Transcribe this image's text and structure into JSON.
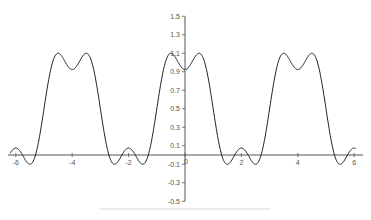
{
  "chart_data": {
    "type": "line",
    "title": "",
    "xlabel": "",
    "ylabel": "",
    "xlim": [
      -6.2,
      6.2
    ],
    "ylim": [
      -0.5,
      1.5
    ],
    "grid": false,
    "legend": null,
    "x_ticks": [
      -6,
      -4,
      -2,
      0,
      2,
      4,
      6
    ],
    "x_tick_labels": [
      "-6",
      "-4",
      "-2",
      "0",
      "2",
      "4",
      "6"
    ],
    "y_ticks": [
      1.5,
      1.3,
      1.1,
      0.9,
      0.7,
      0.5,
      0.3,
      0.1,
      -0.1,
      -0.3,
      -0.5
    ],
    "y_tick_labels": [
      "1.5",
      "1.3",
      "1.1",
      "0.9",
      "0.7",
      "0.5",
      "0.3",
      "0.1",
      "-0.1",
      "-0.3",
      "-0.5"
    ],
    "series": [
      {
        "name": "f(x) = 1/2 + (2/π)(cos(πx/2) − (1/3)cos(3πx/2))",
        "color": "#222222",
        "x": [
          -6,
          -5.5,
          -5,
          -4.6,
          -4.4,
          -4,
          -3.6,
          -3.4,
          -3,
          -2.5,
          -2,
          -1.5,
          -1,
          -0.6,
          -0.4,
          0,
          0.4,
          0.6,
          1,
          1.5,
          2,
          2.5,
          3,
          3.4,
          3.6,
          4,
          4.4,
          4.6,
          5,
          5.5,
          6
        ],
        "y": [
          0.076,
          -0.1,
          0.5,
          1.09,
          1.09,
          0.924,
          1.09,
          1.09,
          0.5,
          -0.1,
          0.076,
          -0.1,
          0.5,
          1.09,
          1.09,
          0.924,
          1.09,
          1.09,
          0.5,
          -0.1,
          0.076,
          -0.1,
          0.5,
          1.09,
          1.09,
          0.924,
          1.09,
          1.09,
          0.5,
          -0.1,
          0.076
        ]
      }
    ]
  },
  "axes": {
    "origin_label": "0",
    "colors": {
      "axis": "#555555",
      "curve": "#222222",
      "background": "#ffffff"
    }
  }
}
